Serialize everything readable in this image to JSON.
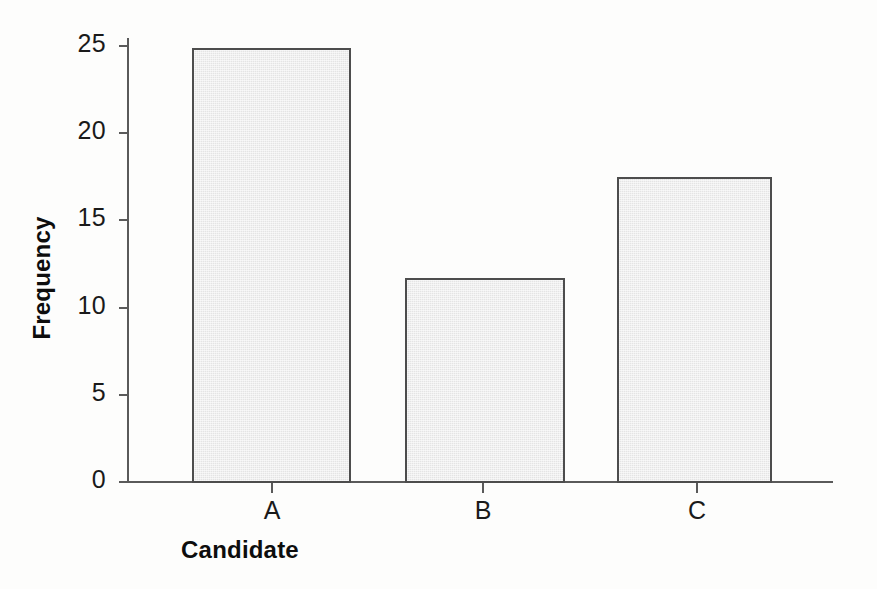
{
  "chart_data": {
    "type": "bar",
    "title": "",
    "xlabel": "Candidate",
    "ylabel": "Frequency",
    "categories": [
      "A",
      "B",
      "C"
    ],
    "values": [
      24.9,
      11.7,
      17.5
    ],
    "ylim": [
      0,
      26
    ],
    "yticks": [
      0,
      5,
      10,
      15,
      20,
      25
    ],
    "ytick_labels": [
      "0",
      "5",
      "10",
      "15",
      "20",
      "25"
    ],
    "grid": false,
    "legend": null,
    "bar_fill_color": "#e4e4e4",
    "bar_edge_color": "#4d4d4d",
    "axis_color": "#5a5a5a",
    "text_color": "#1a1a1a",
    "background_color": "#fdfdfc"
  },
  "axes": {
    "y_axis_name": "frequency-axis",
    "x_axis_name": "candidate-axis"
  }
}
